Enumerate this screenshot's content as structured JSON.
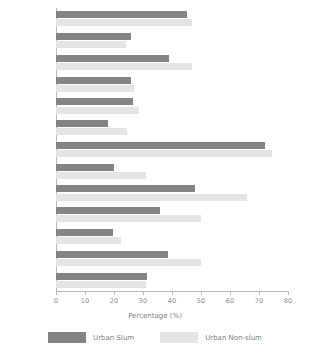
{
  "chart_data": {
    "type": "bar",
    "orientation": "horizontal",
    "title": "",
    "xlabel": "Percentage (%)",
    "ylabel": "",
    "xlim": [
      0,
      80
    ],
    "xticks": [
      0,
      10,
      20,
      30,
      40,
      50,
      60,
      70,
      80
    ],
    "grid": false,
    "legend_position": "bottom",
    "categories": [
      "Cameroon",
      "Côte d Ivoire",
      "Kenya",
      "Mozambique",
      "Nigeria",
      "South Africa",
      "Uganda",
      "Zambia",
      "Zimbabwe",
      "Colombia",
      "Peru",
      "Indonesia",
      "Philippines"
    ],
    "series": [
      {
        "name": "Urban Slum",
        "color": "#848484",
        "values": [
          45,
          26,
          39,
          26,
          26.5,
          18,
          72,
          20,
          48,
          36,
          19.5,
          38.5,
          31.5
        ]
      },
      {
        "name": "Urban Non-slum",
        "color": "#e4e4e4",
        "values": [
          47,
          24,
          47,
          27,
          28.5,
          24.5,
          74.5,
          31,
          66,
          50,
          22.5,
          50,
          31
        ]
      }
    ]
  },
  "legend": {
    "items": [
      {
        "label": "Urban Slum",
        "color": "#848484"
      },
      {
        "label": "Urban Non-slum",
        "color": "#e4e4e4"
      }
    ]
  }
}
